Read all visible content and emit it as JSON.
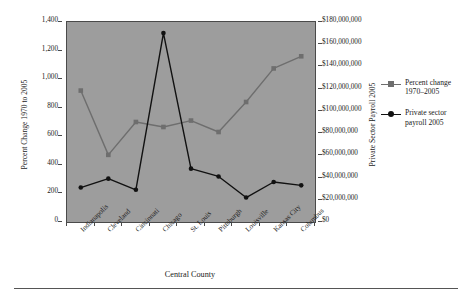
{
  "chart_data": {
    "type": "line",
    "title": "",
    "xlabel": "Central County",
    "ylabel": "Percent Change 1970 to 2005",
    "y2label": "Private Sector Payroll 2005",
    "categories": [
      "Indianapolis",
      "Cleveland",
      "Cincinnati",
      "Chicago",
      "St. Louis",
      "Pittsburgh",
      "Louisville",
      "Kansas City",
      "Columbus"
    ],
    "ylim": [
      0,
      1400
    ],
    "yticks": [
      0,
      200,
      400,
      600,
      800,
      1000,
      1200,
      1400
    ],
    "ytick_labels": [
      "0",
      "200",
      "400",
      "600",
      "800",
      "1,000",
      "1,200",
      "1,400"
    ],
    "y2lim": [
      0,
      180000000
    ],
    "y2ticks": [
      0,
      20000000,
      40000000,
      60000000,
      80000000,
      100000000,
      120000000,
      140000000,
      160000000,
      180000000
    ],
    "y2tick_labels": [
      "$0",
      "$20,000,000",
      "$40,000,000",
      "$60,000,000",
      "$80,000,000",
      "$100,000,000",
      "$120,000,000",
      "$140,000,000",
      "$160,000,000",
      "$180,000,000"
    ],
    "grid": false,
    "legend_position": "right",
    "plot_background": "#9d9d9d",
    "series": [
      {
        "name": "Percent change 1970–2005",
        "axis": "left",
        "color": "#6e6e6e",
        "marker": "square",
        "values": [
          920,
          470,
          700,
          665,
          710,
          630,
          840,
          1075,
          1160
        ]
      },
      {
        "name": "Private sector payroll 2005",
        "axis": "right",
        "color": "#111111",
        "marker": "diamond",
        "values": [
          31000000,
          39000000,
          29000000,
          170000000,
          48000000,
          41000000,
          22000000,
          36000000,
          33000000
        ]
      }
    ]
  },
  "legend": {
    "entries": [
      {
        "line1": "Percent change",
        "line2": "1970–2005",
        "marker": "square-marker-icon",
        "color": "#6e6e6e"
      },
      {
        "line1": "Private sector",
        "line2": "payroll 2005",
        "marker": "diamond-marker-icon",
        "color": "#111111"
      }
    ]
  },
  "axes": {
    "left_title": "Percent Change 1970 to 2005",
    "right_title": "Private Sector Payroll 2005",
    "x_title": "Central County"
  }
}
